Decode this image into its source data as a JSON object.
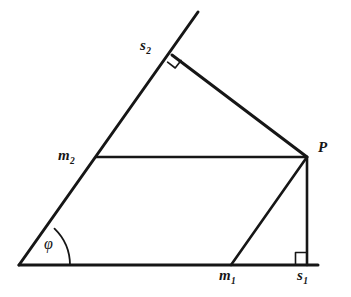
{
  "figure": {
    "kind": "geometric-diagram",
    "stroke_color": "#161616",
    "background_color": "#ffffff",
    "labels": {
      "s2": {
        "base": "s",
        "sub": "2"
      },
      "m2": {
        "base": "m",
        "sub": "2"
      },
      "p": {
        "base": "P",
        "sub": ""
      },
      "m1": {
        "base": "m",
        "sub": "1"
      },
      "s1": {
        "base": "s",
        "sub": "1"
      },
      "phi": {
        "base": "φ",
        "sub": ""
      }
    },
    "points": {
      "origin": {
        "x": 19,
        "y": 265
      },
      "baseline_end": {
        "x": 318,
        "y": 265
      },
      "ray_tip": {
        "x": 198,
        "y": 12
      },
      "m2": {
        "x": 96,
        "y": 157
      },
      "s2": {
        "x": 172,
        "y": 55
      },
      "p": {
        "x": 307,
        "y": 157
      },
      "m1": {
        "x": 231,
        "y": 265
      },
      "s1": {
        "x": 307,
        "y": 265
      }
    },
    "segments": [
      {
        "name": "baseline",
        "from": "origin",
        "to": "baseline_end"
      },
      {
        "name": "inclined-ray",
        "from": "origin",
        "to": "ray_tip"
      },
      {
        "name": "s2-to-p",
        "from": "s2",
        "to": "p"
      },
      {
        "name": "m2-to-p",
        "from": "m2",
        "to": "p"
      },
      {
        "name": "p-to-m1",
        "from": "p",
        "to": "m1"
      },
      {
        "name": "p-to-s1",
        "from": "p",
        "to": "s1"
      }
    ],
    "markers": {
      "right_angle_s2": {
        "at": "s2",
        "type": "right-angle-square",
        "rotated": true
      },
      "right_angle_s1": {
        "at": "s1",
        "type": "right-angle-square",
        "rotated": false
      },
      "angle_phi": {
        "at": "origin",
        "type": "arc",
        "label": "phi"
      }
    }
  }
}
